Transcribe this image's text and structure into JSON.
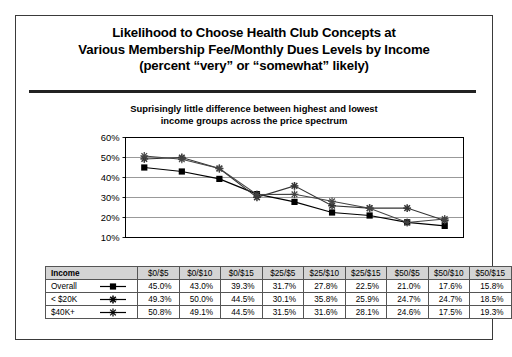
{
  "title": {
    "lines": [
      "Likelihood to Choose Health Club Concepts at",
      "Various Membership Fee/Monthly Dues Levels by Income",
      "(percent “very” or “somewhat” likely)"
    ]
  },
  "subtitle": {
    "lines": [
      "Suprisingly little difference between highest and lowest",
      "income groups across the price spectrum"
    ]
  },
  "table": {
    "row_header_label": "Income",
    "columns": [
      "$0/$5",
      "$0/$10",
      "$0/$15",
      "$25/$5",
      "$25/$10",
      "$25/$15",
      "$50/$5",
      "$50/$10",
      "$50/$15"
    ],
    "rows": [
      {
        "label": "Overall",
        "marker": "filled-square",
        "values": [
          "45.0%",
          "43.0%",
          "39.3%",
          "31.7%",
          "27.8%",
          "22.5%",
          "21.0%",
          "17.6%",
          "15.8%"
        ]
      },
      {
        "label": "< $20K",
        "marker": "star",
        "values": [
          "49.3%",
          "50.0%",
          "44.5%",
          "30.1%",
          "35.8%",
          "25.9%",
          "24.7%",
          "24.7%",
          "18.5%"
        ]
      },
      {
        "label": "$40K+",
        "marker": "asterisk",
        "values": [
          "50.8%",
          "49.1%",
          "44.5%",
          "31.5%",
          "31.6%",
          "28.1%",
          "24.6%",
          "17.5%",
          "19.3%"
        ]
      }
    ]
  },
  "chart_data": {
    "type": "line",
    "title": "Likelihood to Choose Health Club Concepts at Various Membership Fee/Monthly Dues Levels by Income (percent “very” or “somewhat” likely)",
    "subtitle": "Suprisingly little difference between highest and lowest income groups across the price spectrum",
    "xlabel": "",
    "ylabel": "",
    "categories": [
      "$0/$5",
      "$0/$10",
      "$0/$15",
      "$25/$5",
      "$25/$10",
      "$25/$15",
      "$50/$5",
      "$50/$10",
      "$50/$15"
    ],
    "ylim": [
      10,
      60
    ],
    "ytick_labels": [
      "10%",
      "20%",
      "30%",
      "40%",
      "50%",
      "60%"
    ],
    "ytick_values": [
      10,
      20,
      30,
      40,
      50,
      60
    ],
    "grid": "horizontal",
    "legend_position": "table-row-headers",
    "series": [
      {
        "name": "Overall",
        "marker": "filled-square",
        "color": "#000000",
        "values": [
          45.0,
          43.0,
          39.3,
          31.7,
          27.8,
          22.5,
          21.0,
          17.6,
          15.8
        ]
      },
      {
        "name": "< $20K",
        "marker": "star",
        "color": "#333333",
        "values": [
          49.3,
          50.0,
          44.5,
          30.1,
          35.8,
          25.9,
          24.7,
          24.7,
          18.5
        ]
      },
      {
        "name": "$40K+",
        "marker": "asterisk",
        "color": "#444444",
        "values": [
          50.8,
          49.1,
          44.5,
          31.5,
          31.6,
          28.1,
          24.6,
          17.5,
          19.3
        ]
      }
    ]
  }
}
